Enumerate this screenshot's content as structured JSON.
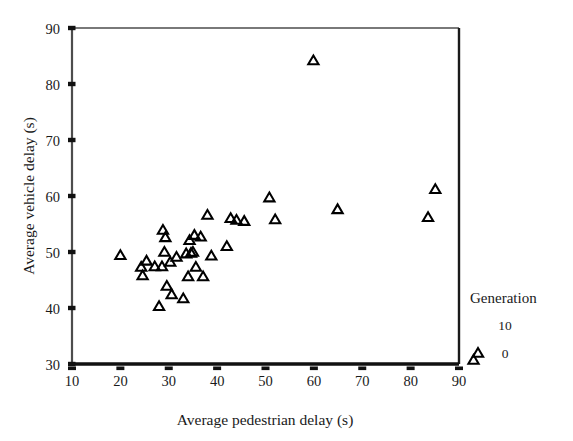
{
  "chart_data": {
    "type": "scatter",
    "title": "",
    "xlabel": "Average pedestrian delay (s)",
    "ylabel": "Average vehicle delay (s)",
    "xlim": [
      10,
      90
    ],
    "ylim": [
      30,
      90
    ],
    "xticks": [
      10,
      20,
      30,
      40,
      50,
      60,
      70,
      80,
      90
    ],
    "yticks": [
      30,
      40,
      50,
      60,
      70,
      80,
      90
    ],
    "grid": false,
    "marker": "open-triangle",
    "marker_color": "#000000",
    "legend": {
      "position": "right-outside-bottom",
      "title": "Generation",
      "entries": [
        {
          "label": "10",
          "marker": false
        },
        {
          "label": "0",
          "marker": true
        }
      ]
    },
    "series": [
      {
        "name": "Generation 0",
        "points": [
          [
            20.0,
            49.4
          ],
          [
            24.3,
            47.3
          ],
          [
            24.6,
            45.8
          ],
          [
            25.4,
            48.4
          ],
          [
            27.1,
            47.4
          ],
          [
            28.0,
            40.3
          ],
          [
            28.6,
            47.4
          ],
          [
            28.8,
            53.9
          ],
          [
            29.1,
            50.0
          ],
          [
            29.3,
            52.6
          ],
          [
            29.6,
            43.9
          ],
          [
            30.3,
            48.2
          ],
          [
            30.6,
            42.4
          ],
          [
            31.6,
            49.1
          ],
          [
            33.0,
            41.7
          ],
          [
            33.6,
            49.7
          ],
          [
            34.0,
            45.6
          ],
          [
            34.3,
            52.1
          ],
          [
            34.6,
            49.8
          ],
          [
            35.0,
            50.0
          ],
          [
            35.3,
            53.0
          ],
          [
            35.6,
            47.3
          ],
          [
            36.6,
            52.7
          ],
          [
            37.1,
            45.6
          ],
          [
            38.0,
            56.6
          ],
          [
            38.8,
            49.3
          ],
          [
            42.0,
            51.0
          ],
          [
            42.8,
            56.0
          ],
          [
            44.0,
            55.7
          ],
          [
            45.6,
            55.5
          ],
          [
            50.8,
            59.7
          ],
          [
            52.0,
            55.8
          ],
          [
            59.9,
            84.2
          ],
          [
            64.9,
            57.6
          ],
          [
            83.6,
            56.2
          ],
          [
            85.1,
            61.2
          ],
          [
            93.0,
            30.7
          ]
        ]
      }
    ]
  }
}
